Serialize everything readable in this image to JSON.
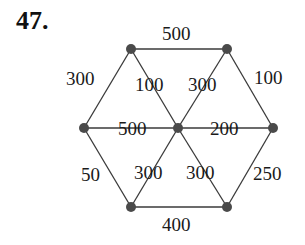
{
  "problem_number": "47.",
  "graph": {
    "nodes": [
      {
        "id": "top-left",
        "x": 131,
        "y": 49
      },
      {
        "id": "top-right",
        "x": 227,
        "y": 49
      },
      {
        "id": "left",
        "x": 84,
        "y": 128
      },
      {
        "id": "center",
        "x": 178,
        "y": 128
      },
      {
        "id": "right",
        "x": 273,
        "y": 128
      },
      {
        "id": "bottom-left",
        "x": 131,
        "y": 207
      },
      {
        "id": "bottom-right",
        "x": 227,
        "y": 207
      }
    ],
    "edges": [
      {
        "from": "top-left",
        "to": "top-right",
        "weight": "500",
        "lx": 162,
        "ly": 40
      },
      {
        "from": "top-right",
        "to": "right",
        "weight": "100",
        "lx": 254,
        "ly": 84
      },
      {
        "from": "right",
        "to": "bottom-right",
        "weight": "250",
        "lx": 253,
        "ly": 180
      },
      {
        "from": "bottom-left",
        "to": "bottom-right",
        "weight": "400",
        "lx": 162,
        "ly": 231
      },
      {
        "from": "left",
        "to": "bottom-left",
        "weight": "50",
        "lx": 81,
        "ly": 181
      },
      {
        "from": "left",
        "to": "top-left",
        "weight": "300",
        "lx": 66,
        "ly": 85
      },
      {
        "from": "top-left",
        "to": "center",
        "weight": "100",
        "lx": 135,
        "ly": 91
      },
      {
        "from": "top-right",
        "to": "center",
        "weight": "300",
        "lx": 188,
        "ly": 91
      },
      {
        "from": "left",
        "to": "center",
        "weight": "500",
        "lx": 118,
        "ly": 135
      },
      {
        "from": "center",
        "to": "right",
        "weight": "200",
        "lx": 210,
        "ly": 135
      },
      {
        "from": "bottom-left",
        "to": "center",
        "weight": "300",
        "lx": 134,
        "ly": 179
      },
      {
        "from": "bottom-right",
        "to": "center",
        "weight": "300",
        "lx": 186,
        "ly": 179
      }
    ]
  }
}
